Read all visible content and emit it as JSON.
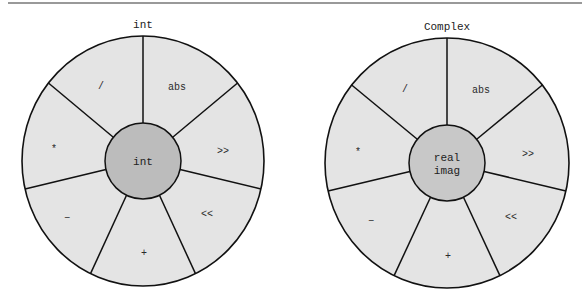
{
  "figure": {
    "top_rule": {
      "x1": 8,
      "x2": 582,
      "y": 3,
      "color": "#777777"
    },
    "colors": {
      "outer_fill": "#e4e4e4",
      "core_fill_left": "#bcbcbc",
      "core_fill_right": "#c8c8c8",
      "stroke": "#111111"
    },
    "segment_count": 7,
    "divider_angles_deg": [
      90,
      38.6,
      -12.9,
      -64.3,
      -115.7,
      -167.1,
      141.4
    ],
    "wheels": [
      {
        "id": "int",
        "title": "int",
        "center": {
          "x": 143,
          "y": 161
        },
        "outer_rx": 121,
        "outer_ry": 125,
        "core_r": 38,
        "core_lines": [
          "int"
        ],
        "segments": [
          {
            "label": "abs",
            "x": 177,
            "y": 90
          },
          {
            "label": ">>",
            "x": 223,
            "y": 154
          },
          {
            "label": "<<",
            "x": 207,
            "y": 217
          },
          {
            "label": "+",
            "x": 144,
            "y": 256
          },
          {
            "label": "−",
            "x": 67,
            "y": 221
          },
          {
            "label": "*",
            "x": 54,
            "y": 152
          },
          {
            "label": "/",
            "x": 101,
            "y": 89
          }
        ]
      },
      {
        "id": "complex",
        "title": "Complex",
        "center": {
          "x": 447,
          "y": 163
        },
        "outer_rx": 122,
        "outer_ry": 125,
        "core_r": 38,
        "core_lines": [
          "real",
          "imag"
        ],
        "segments": [
          {
            "label": "abs",
            "x": 481,
            "y": 93
          },
          {
            "label": ">>",
            "x": 528,
            "y": 157
          },
          {
            "label": "<<",
            "x": 511,
            "y": 220
          },
          {
            "label": "+",
            "x": 448,
            "y": 259
          },
          {
            "label": "−",
            "x": 371,
            "y": 224
          },
          {
            "label": "*",
            "x": 358,
            "y": 155
          },
          {
            "label": "/",
            "x": 405,
            "y": 92
          }
        ]
      }
    ]
  }
}
